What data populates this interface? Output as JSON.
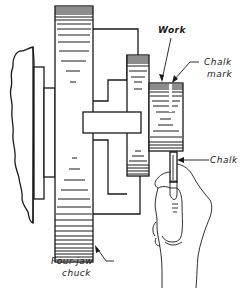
{
  "diagram": {
    "labels": {
      "work": "Work",
      "chalk_mark_line1": "Chalk",
      "chalk_mark_line2": "mark",
      "chalk": "Chalk",
      "chuck_line1": "Four-jaw",
      "chuck_line2": "chuck"
    },
    "components": [
      "headstock-spindle",
      "spindle-collar",
      "chuck-body",
      "chuck-jaw-upper",
      "chuck-jaw-lower",
      "center-boss",
      "work-flange",
      "work-piece",
      "chalk-stick",
      "hand"
    ],
    "colors": {
      "line": "#1a1a1a",
      "background": "#ffffff"
    }
  }
}
